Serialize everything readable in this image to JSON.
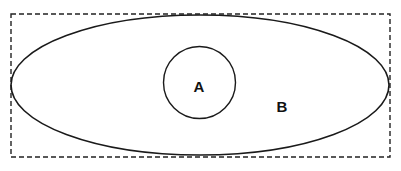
{
  "diagram": {
    "type": "venn-subset",
    "universe": {
      "style": "dashed-rectangle",
      "color": "#222222"
    },
    "sets": [
      {
        "id": "B",
        "label": "B",
        "shape": "ellipse",
        "contains": [
          "A"
        ]
      },
      {
        "id": "A",
        "label": "A",
        "shape": "circle"
      }
    ],
    "colors": {
      "stroke": "#1a1a1a",
      "background": "#ffffff",
      "text": "#111111"
    }
  }
}
